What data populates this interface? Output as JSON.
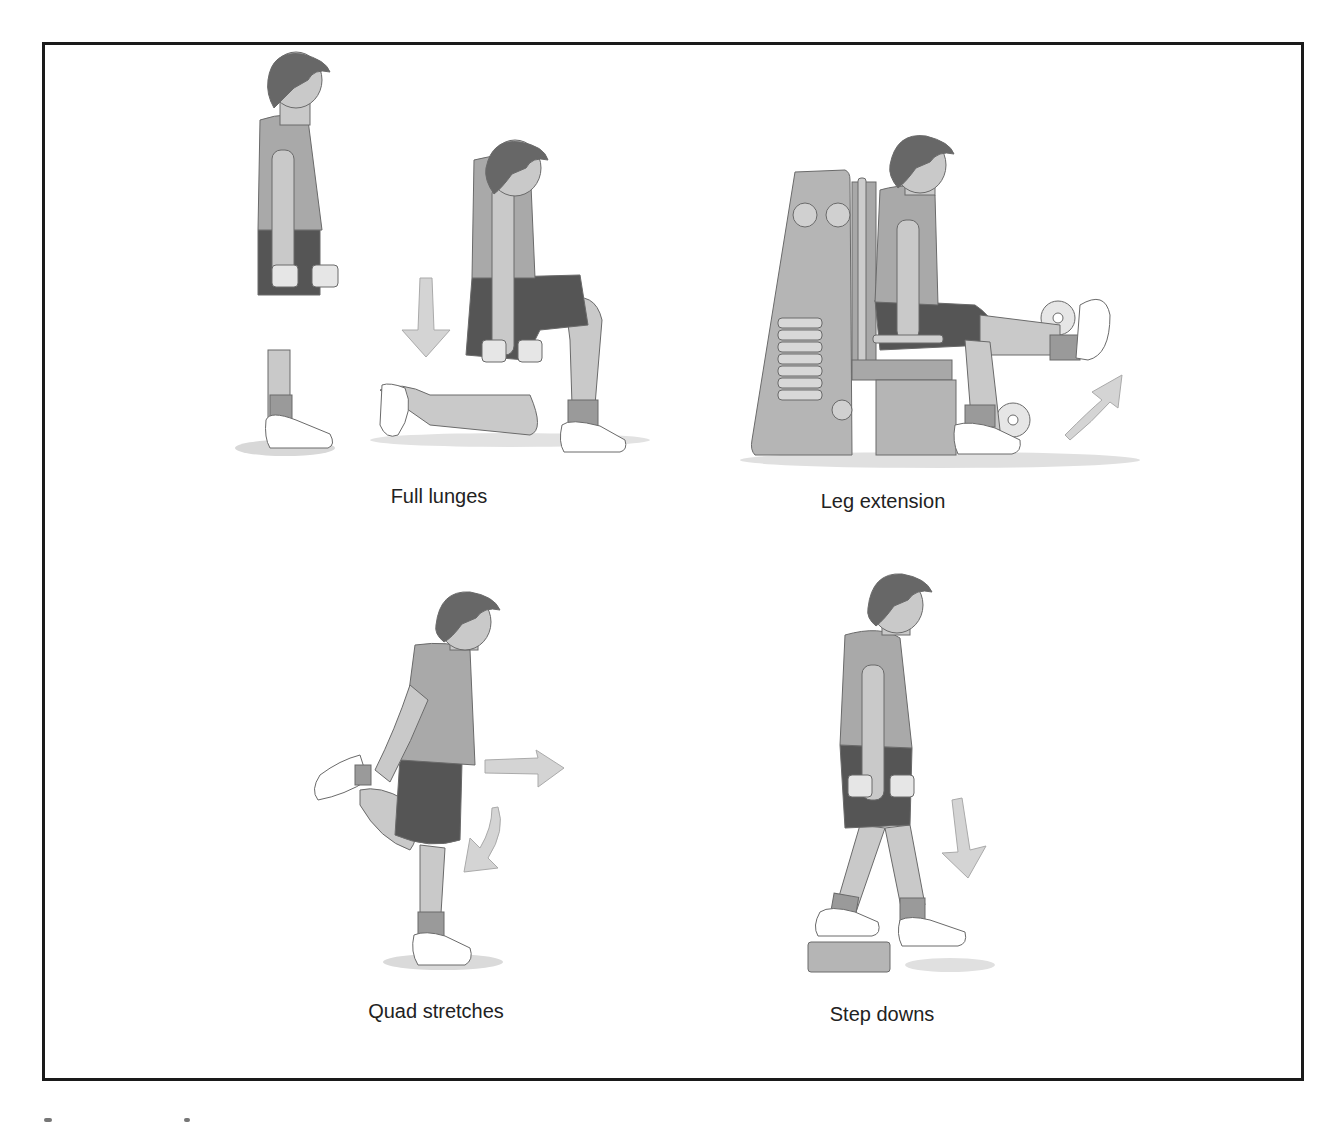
{
  "figure": {
    "panels": [
      {
        "id": "full-lunges",
        "caption": "Full lunges"
      },
      {
        "id": "leg-extension",
        "caption": "Leg extension"
      },
      {
        "id": "quad-stretches",
        "caption": "Quad stretches"
      },
      {
        "id": "step-downs",
        "caption": "Step downs"
      }
    ]
  },
  "colors": {
    "frame": "#1a1a1a",
    "shirt": "#a9a9a9",
    "shorts": "#555555",
    "skin": "#c9c9c9",
    "hair": "#676767",
    "shoe": "#ffffff",
    "arrow": "#d4d4d4",
    "machine": "#b5b5b5",
    "outline": "#6a6a6a"
  }
}
